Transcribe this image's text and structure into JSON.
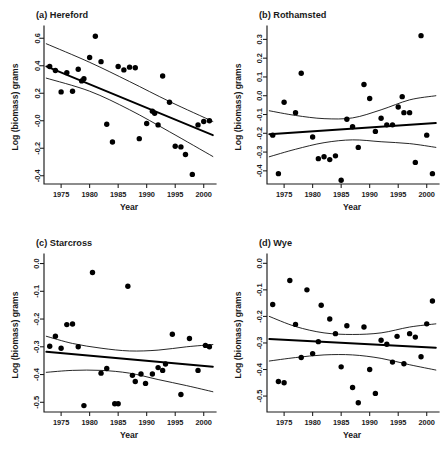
{
  "figure": {
    "width": 447,
    "height": 456,
    "background": "#ffffff",
    "point_color": "#000000",
    "line_color": "#000000",
    "axis_color": "#1a1a1a"
  },
  "chart_data": [
    {
      "type": "scatter",
      "panel": "a",
      "title": "(a) Hereford",
      "xlabel": "Year",
      "ylabel": "Log (biomass) grams",
      "xlim": [
        1972.0,
        2001.8
      ],
      "ylim": [
        -0.46,
        0.66
      ],
      "xticks": [
        1975,
        1980,
        1985,
        1990,
        1995,
        2000
      ],
      "xticklabels": [
        "1975",
        "1980",
        "1985",
        "1990",
        "1995",
        "2000"
      ],
      "yticks": [
        0.6,
        0.4,
        0.2,
        -0.0,
        -0.2,
        -0.4
      ],
      "yticklabels": [
        "0.6",
        "0.4",
        "0.2",
        "-0.0",
        "-0.2",
        "-0.4"
      ],
      "grid": false,
      "legend": "none",
      "x": [
        1973,
        1974,
        1975,
        1976,
        1977,
        1978,
        1978.6,
        1979,
        1980,
        1981,
        1982,
        1983,
        1984,
        1985,
        1986,
        1987,
        1988,
        1988.7,
        1990,
        1991,
        1991.4,
        1992,
        1992.8,
        1994,
        1995,
        1996,
        1996.8,
        1998,
        1999,
        2000,
        2001
      ],
      "y": [
        0.395,
        0.365,
        0.21,
        0.35,
        0.215,
        0.375,
        0.29,
        0.305,
        0.46,
        0.615,
        0.43,
        -0.025,
        -0.155,
        0.395,
        0.37,
        0.39,
        0.385,
        -0.13,
        -0.02,
        0.07,
        0.055,
        -0.03,
        0.325,
        0.135,
        -0.185,
        -0.19,
        -0.245,
        -0.39,
        -0.03,
        -0.005,
        0.0
      ],
      "fit": {
        "x": [
          1972.4,
          2001.6
        ],
        "y": [
          0.395,
          -0.105
        ]
      },
      "ci_upper": {
        "x": [
          1972.4,
          1980,
          1987,
          1994,
          2001.6
        ],
        "y": [
          0.56,
          0.425,
          0.285,
          0.14,
          -0.005
        ]
      },
      "ci_lower": {
        "x": [
          1972.4,
          1980,
          1987,
          1994,
          2001.6
        ],
        "y": [
          0.31,
          0.215,
          0.08,
          -0.08,
          -0.26
        ]
      }
    },
    {
      "type": "scatter",
      "panel": "b",
      "title": "(b) Rothamsted",
      "xlabel": "Year",
      "ylabel": "Log (biomass) grams",
      "xlim": [
        1972.0,
        2001.8
      ],
      "ylim": [
        -0.47,
        0.35
      ],
      "xticks": [
        1975,
        1980,
        1985,
        1990,
        1995,
        2000
      ],
      "xticklabels": [
        "1975",
        "1980",
        "1985",
        "1990",
        "1995",
        "2000"
      ],
      "yticks": [
        0.3,
        0.2,
        0.1,
        0.0,
        -0.1,
        -0.2,
        -0.3,
        -0.4
      ],
      "yticklabels": [
        "0.3",
        "0.2",
        "0.1",
        "0.0",
        "-0.1",
        "-0.2",
        "-0.3",
        "-0.4"
      ],
      "grid": false,
      "legend": "none",
      "x": [
        1973,
        1974,
        1975,
        1977,
        1978,
        1980,
        1981,
        1982,
        1983,
        1984,
        1985,
        1986,
        1987,
        1988,
        1989,
        1990,
        1991,
        1992,
        1993,
        1994,
        1995,
        1995.7,
        1996,
        1997,
        1998,
        1999,
        2000,
        2001
      ],
      "y": [
        -0.21,
        -0.415,
        -0.035,
        -0.09,
        0.12,
        -0.22,
        -0.335,
        -0.325,
        -0.34,
        -0.32,
        -0.45,
        -0.125,
        -0.165,
        -0.275,
        0.06,
        -0.015,
        -0.19,
        -0.12,
        -0.155,
        -0.155,
        -0.06,
        -0.005,
        -0.09,
        -0.09,
        -0.355,
        0.32,
        -0.21,
        -0.415
      ],
      "fit": {
        "x": [
          1972.4,
          2001.6
        ],
        "y": [
          -0.205,
          -0.145
        ]
      },
      "ci_upper": {
        "x": [
          1972.4,
          1977,
          1982,
          1987,
          1992,
          1997,
          2001.6
        ],
        "y": [
          -0.08,
          -0.105,
          -0.122,
          -0.118,
          -0.075,
          -0.022,
          0.0
        ]
      },
      "ci_lower": {
        "x": [
          1972.4,
          1977,
          1982,
          1987,
          1992,
          1997,
          2001.6
        ],
        "y": [
          -0.325,
          -0.285,
          -0.25,
          -0.235,
          -0.245,
          -0.255,
          -0.275
        ]
      }
    },
    {
      "type": "scatter",
      "panel": "c",
      "title": "(c) Starcross",
      "xlabel": "Year",
      "ylabel": "Log (biomass) grams",
      "xlim": [
        1972.0,
        2001.8
      ],
      "ylim": [
        -0.535,
        0.02
      ],
      "xticks": [
        1975,
        1980,
        1985,
        1990,
        1995,
        2000
      ],
      "xticklabels": [
        "1975",
        "1980",
        "1985",
        "1990",
        "1995",
        "2000"
      ],
      "yticks": [
        0.0,
        -0.1,
        -0.2,
        -0.3,
        -0.4,
        -0.5
      ],
      "yticklabels": [
        "0.0",
        "-0.1",
        "-0.2",
        "-0.3",
        "-0.4",
        "-0.5"
      ],
      "grid": false,
      "legend": "none",
      "x": [
        1973,
        1974,
        1975,
        1976,
        1977,
        1978,
        1979,
        1980.5,
        1982,
        1983,
        1984.4,
        1985,
        1986.7,
        1987.5,
        1988,
        1989,
        1989.8,
        1991,
        1992,
        1992.8,
        1993.3,
        1994.5,
        1996,
        1997.5,
        1999,
        2000.3,
        2001
      ],
      "y": [
        -0.298,
        -0.262,
        -0.305,
        -0.22,
        -0.218,
        -0.3,
        -0.512,
        -0.032,
        -0.395,
        -0.378,
        -0.505,
        -0.505,
        -0.082,
        -0.403,
        -0.425,
        -0.398,
        -0.432,
        -0.398,
        -0.375,
        -0.385,
        -0.362,
        -0.255,
        -0.472,
        -0.27,
        -0.385,
        -0.295,
        -0.3
      ],
      "fit": {
        "x": [
          1972.4,
          2001.6
        ],
        "y": [
          -0.318,
          -0.372
        ]
      },
      "ci_upper": {
        "x": [
          1972.4,
          1977,
          1982,
          1987,
          1992,
          1997,
          2001.6
        ],
        "y": [
          -0.262,
          -0.288,
          -0.305,
          -0.315,
          -0.312,
          -0.3,
          -0.292
        ]
      },
      "ci_lower": {
        "x": [
          1972.4,
          1977,
          1982,
          1987,
          1992,
          1997,
          2001.6
        ],
        "y": [
          -0.392,
          -0.385,
          -0.385,
          -0.395,
          -0.418,
          -0.44,
          -0.462
        ]
      }
    },
    {
      "type": "scatter",
      "panel": "d",
      "title": "(d) Wye",
      "xlabel": "Year",
      "ylabel": "Log (biomass) grams",
      "xlim": [
        1972.0,
        2001.8
      ],
      "ylim": [
        -0.56,
        0.02
      ],
      "xticks": [
        1975,
        1980,
        1985,
        1990,
        1995,
        2000
      ],
      "xticklabels": [
        "1975",
        "1980",
        "1985",
        "1990",
        "1995",
        "2000"
      ],
      "yticks": [
        0.0,
        -0.1,
        -0.2,
        -0.3,
        -0.4,
        -0.5
      ],
      "yticklabels": [
        "0.0",
        "-0.1",
        "-0.2",
        "-0.3",
        "-0.4",
        "-0.5"
      ],
      "grid": false,
      "legend": "none",
      "x": [
        1973,
        1974,
        1975,
        1976,
        1977,
        1978,
        1979,
        1980,
        1981,
        1981.5,
        1983,
        1984,
        1985,
        1986,
        1987,
        1988,
        1989,
        1990,
        1991,
        1992,
        1993,
        1994,
        1994.8,
        1996,
        1997,
        1998,
        1999,
        2000,
        2001
      ],
      "y": [
        -0.155,
        -0.445,
        -0.45,
        -0.065,
        -0.23,
        -0.355,
        -0.1,
        -0.34,
        -0.295,
        -0.158,
        -0.21,
        -0.265,
        -0.39,
        -0.235,
        -0.468,
        -0.525,
        -0.24,
        -0.4,
        -0.49,
        -0.29,
        -0.305,
        -0.372,
        -0.275,
        -0.378,
        -0.265,
        -0.278,
        -0.352,
        -0.228,
        -0.142
      ],
      "fit": {
        "x": [
          1972.4,
          2001.6
        ],
        "y": [
          -0.285,
          -0.318
        ]
      },
      "ci_upper": {
        "x": [
          1972.4,
          1977,
          1982,
          1987,
          1992,
          1997,
          2001.6
        ],
        "y": [
          -0.2,
          -0.238,
          -0.262,
          -0.268,
          -0.262,
          -0.24,
          -0.228
        ]
      },
      "ci_lower": {
        "x": [
          1972.4,
          1977,
          1982,
          1987,
          1992,
          1997,
          2001.6
        ],
        "y": [
          -0.368,
          -0.355,
          -0.345,
          -0.345,
          -0.358,
          -0.382,
          -0.402
        ]
      }
    }
  ]
}
